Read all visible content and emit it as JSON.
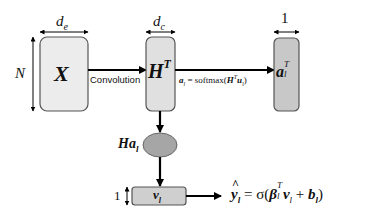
{
  "diagram": {
    "nodes": {
      "x_box": {
        "label": "X",
        "width_label": "d",
        "width_sub": "e",
        "height_label": "N",
        "fill": "#ececec"
      },
      "ht_box": {
        "label": "H",
        "label_sup": "T",
        "width_label": "d",
        "width_sub": "c",
        "fill": "#e0e0e0"
      },
      "a_box": {
        "label": "a",
        "label_sub": "l",
        "label_sup": "T",
        "width_label": "1",
        "fill": "#c8c8c8"
      },
      "ha_ellipse": {
        "label": "Ha",
        "label_sub": "l",
        "fill": "#a6a6a6"
      },
      "v_box": {
        "label": "v",
        "label_sub": "l",
        "height_label": "1",
        "fill": "#cfcfcf"
      }
    },
    "edges": {
      "convolution": {
        "label": "Convolution"
      },
      "softmax": {
        "lhs": "a",
        "lhs_sub": "l",
        "eq": " = softmax(",
        "h": "H",
        "h_sup": "T",
        "u": "u",
        "u_sub": "l",
        "close": ")"
      },
      "output": {
        "y": "y",
        "y_hat": "^",
        "y_sub": "l",
        "eq": " = σ(",
        "beta": "β",
        "beta_sub": "l",
        "beta_sup": "T",
        "v": "v",
        "v_sub": "l",
        "plus": " + ",
        "b": "b",
        "b_sub": "l",
        "close": ")"
      }
    }
  }
}
